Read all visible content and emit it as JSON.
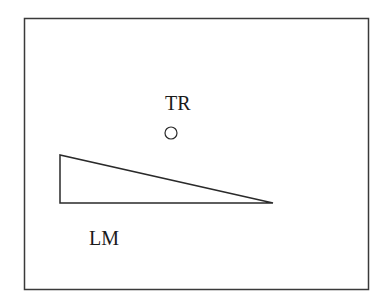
{
  "diagram": {
    "frame": {
      "x": 24,
      "y": 18,
      "width": 344,
      "height": 271,
      "stroke": "#3a3a3a"
    },
    "labels": {
      "trajector": "TR",
      "landmark": "LM"
    },
    "trajector_shape": "circle",
    "landmark_shape": "right-triangle (ramp)",
    "colors": {
      "stroke": "#2a2a2a",
      "text": "#1a1a1a",
      "background": "#ffffff"
    }
  }
}
